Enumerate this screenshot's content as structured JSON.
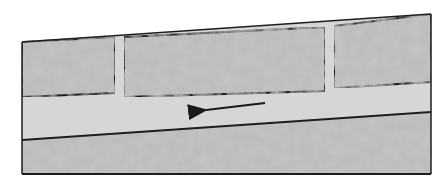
{
  "diagram": {
    "type": "cross-section",
    "colors": {
      "background": "#ffffff",
      "block_fill": "#b4b4b4",
      "block_texture_dark": "#8e8e8e",
      "block_texture_light": "#d2d2d2",
      "channel_fill": "#d6d6d6",
      "outline": "#1e1e1e",
      "arrow": "#1a1a1a"
    },
    "elements": {
      "upper_blocks": [
        {
          "id": "block-1",
          "points": [
            [
              22,
              42
            ],
            [
              115,
              37
            ],
            [
              115,
              93
            ],
            [
              22,
              97
            ]
          ]
        },
        {
          "id": "block-2",
          "points": [
            [
              124,
              37
            ],
            [
              325,
              27
            ],
            [
              325,
              91
            ],
            [
              124,
              97
            ]
          ]
        },
        {
          "id": "block-3",
          "points": [
            [
              334,
              26
            ],
            [
              431,
              14
            ],
            [
              431,
              82
            ],
            [
              334,
              88
            ]
          ]
        }
      ],
      "slots": [
        {
          "id": "slot-1",
          "x_range": [
            115,
            124
          ]
        },
        {
          "id": "slot-2",
          "x_range": [
            325,
            334
          ]
        }
      ],
      "channel": {
        "top_left": [
          22,
          97
        ],
        "top_right": [
          431,
          82
        ],
        "bottom_left": [
          22,
          140
        ],
        "bottom_right": [
          431,
          112
        ]
      },
      "lower_block": {
        "points": [
          [
            22,
            140
          ],
          [
            431,
            112
          ],
          [
            431,
            174
          ],
          [
            22,
            174
          ]
        ]
      },
      "flow_arrow": {
        "from": [
          265,
          103
        ],
        "to": [
          198,
          111
        ],
        "direction": "left"
      }
    }
  }
}
